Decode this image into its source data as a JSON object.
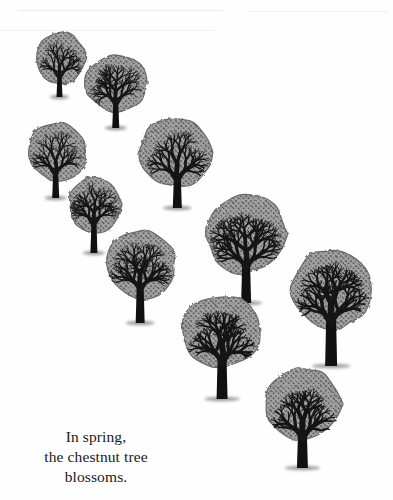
{
  "illustration": {
    "subject": "chestnut trees",
    "tree_count": 10,
    "colors": {
      "background": "#fefefe",
      "crown_fill": "#8a8a8a",
      "crown_dark": "#3a3a3a",
      "branch": "#151515",
      "trunk": "#111111",
      "shadow": "#9a9a9a"
    },
    "trees": [
      {
        "id": "tree-1",
        "cx": 61,
        "cy": 58,
        "rx": 25,
        "ry": 27,
        "trunk_top": 75,
        "trunk_bottom": 97,
        "trunk_w": 6
      },
      {
        "id": "tree-2",
        "cx": 117,
        "cy": 83,
        "rx": 32,
        "ry": 30,
        "trunk_top": 102,
        "trunk_bottom": 128,
        "trunk_w": 7
      },
      {
        "id": "tree-3",
        "cx": 57,
        "cy": 152,
        "rx": 30,
        "ry": 30,
        "trunk_top": 172,
        "trunk_bottom": 198,
        "trunk_w": 7
      },
      {
        "id": "tree-4",
        "cx": 176,
        "cy": 152,
        "rx": 37,
        "ry": 37,
        "trunk_top": 178,
        "trunk_bottom": 208,
        "trunk_w": 9
      },
      {
        "id": "tree-5",
        "cx": 95,
        "cy": 204,
        "rx": 27,
        "ry": 29,
        "trunk_top": 222,
        "trunk_bottom": 253,
        "trunk_w": 7
      },
      {
        "id": "tree-6",
        "cx": 141,
        "cy": 264,
        "rx": 36,
        "ry": 36,
        "trunk_top": 288,
        "trunk_bottom": 323,
        "trunk_w": 9
      },
      {
        "id": "tree-7",
        "cx": 246,
        "cy": 234,
        "rx": 41,
        "ry": 41,
        "trunk_top": 266,
        "trunk_bottom": 303,
        "trunk_w": 10
      },
      {
        "id": "tree-8",
        "cx": 331,
        "cy": 289,
        "rx": 41,
        "ry": 42,
        "trunk_top": 320,
        "trunk_bottom": 366,
        "trunk_w": 12
      },
      {
        "id": "tree-9",
        "cx": 221,
        "cy": 332,
        "rx": 40,
        "ry": 38,
        "trunk_top": 360,
        "trunk_bottom": 399,
        "trunk_w": 11
      },
      {
        "id": "tree-10",
        "cx": 303,
        "cy": 404,
        "rx": 40,
        "ry": 37,
        "trunk_top": 436,
        "trunk_bottom": 468,
        "trunk_w": 11
      }
    ]
  },
  "caption": {
    "lines": [
      "In spring,",
      "the chestnut tree",
      "blossoms."
    ]
  }
}
